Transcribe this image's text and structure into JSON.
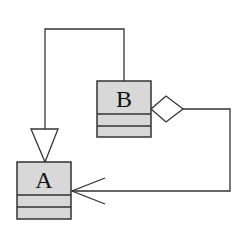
{
  "diagram": {
    "type": "uml-class-diagram",
    "colors": {
      "box_fill": "#d8d8d8",
      "stroke": "#333333",
      "background": "#ffffff"
    },
    "classes": [
      {
        "id": "A",
        "name": "A",
        "x": 17,
        "y": 162,
        "w": 54,
        "h": 57,
        "dividers": [
          195,
          207
        ]
      },
      {
        "id": "B",
        "name": "B",
        "x": 97,
        "y": 81,
        "w": 54,
        "h": 56,
        "dividers": [
          114,
          126
        ]
      }
    ],
    "relationships": [
      {
        "type": "generalization",
        "from": "B",
        "to": "A",
        "arrowhead": "hollow-triangle"
      },
      {
        "type": "aggregation",
        "from": "B",
        "to": "A",
        "source_end": "hollow-diamond",
        "arrowhead": "open-arrow"
      }
    ]
  }
}
